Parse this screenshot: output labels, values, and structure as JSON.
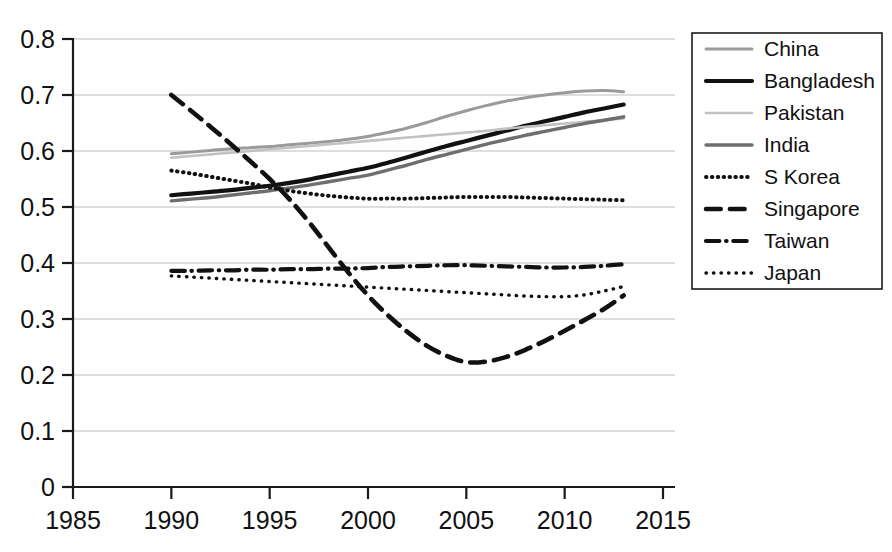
{
  "chart_data": {
    "type": "line",
    "title": "",
    "subtitle": "",
    "xlabel": "",
    "ylabel": "",
    "xlim": [
      1985,
      2015
    ],
    "ylim": [
      0,
      0.8
    ],
    "x_ticks": [
      1985,
      1990,
      1995,
      2000,
      2005,
      2010,
      2015
    ],
    "y_ticks": [
      "0",
      "0.1",
      "0.2",
      "0.3",
      "0.4",
      "0.5",
      "0.6",
      "0.7",
      "0.8"
    ],
    "grid": "horizontal",
    "legend_position": "right",
    "series": [
      {
        "name": "China",
        "style": "solid",
        "color": "#9a9a9a",
        "width": 3.0,
        "x": [
          1990,
          1991,
          1992,
          1993,
          1994,
          1995,
          1996,
          1997,
          1998,
          1999,
          2000,
          2001,
          2002,
          2003,
          2004,
          2005,
          2006,
          2007,
          2008,
          2009,
          2010,
          2011,
          2012,
          2013
        ],
        "values": [
          0.595,
          0.598,
          0.601,
          0.604,
          0.606,
          0.608,
          0.611,
          0.614,
          0.617,
          0.621,
          0.626,
          0.633,
          0.641,
          0.651,
          0.662,
          0.672,
          0.681,
          0.689,
          0.695,
          0.7,
          0.704,
          0.707,
          0.708,
          0.706
        ]
      },
      {
        "name": "Bangladesh",
        "style": "solid",
        "color": "#111111",
        "width": 4.2,
        "x": [
          1990,
          1991,
          1992,
          1993,
          1994,
          1995,
          1996,
          1997,
          1998,
          1999,
          2000,
          2001,
          2002,
          2003,
          2004,
          2005,
          2006,
          2007,
          2008,
          2009,
          2010,
          2011,
          2012,
          2013
        ],
        "values": [
          0.521,
          0.524,
          0.527,
          0.53,
          0.534,
          0.538,
          0.543,
          0.549,
          0.556,
          0.563,
          0.57,
          0.579,
          0.589,
          0.599,
          0.609,
          0.618,
          0.627,
          0.636,
          0.645,
          0.653,
          0.661,
          0.669,
          0.676,
          0.683
        ]
      },
      {
        "name": "Pakistan",
        "style": "solid",
        "color": "#c2c2c2",
        "width": 2.6,
        "x": [
          1990,
          1991,
          1992,
          1993,
          1994,
          1995,
          1996,
          1997,
          1998,
          1999,
          2000,
          2001,
          2002,
          2003,
          2004,
          2005,
          2006,
          2007,
          2008,
          2009,
          2010,
          2011,
          2012,
          2013
        ],
        "values": [
          0.588,
          0.591,
          0.594,
          0.597,
          0.6,
          0.603,
          0.606,
          0.609,
          0.612,
          0.615,
          0.618,
          0.621,
          0.624,
          0.627,
          0.63,
          0.633,
          0.636,
          0.64,
          0.643,
          0.646,
          0.649,
          0.652,
          0.655,
          0.658
        ]
      },
      {
        "name": "India",
        "style": "solid",
        "color": "#6e6e6e",
        "width": 3.4,
        "x": [
          1990,
          1991,
          1992,
          1993,
          1994,
          1995,
          1996,
          1997,
          1998,
          1999,
          2000,
          2001,
          2002,
          2003,
          2004,
          2005,
          2006,
          2007,
          2008,
          2009,
          2010,
          2011,
          2012,
          2013
        ],
        "values": [
          0.511,
          0.514,
          0.517,
          0.521,
          0.525,
          0.529,
          0.534,
          0.539,
          0.545,
          0.551,
          0.557,
          0.566,
          0.575,
          0.585,
          0.594,
          0.603,
          0.612,
          0.62,
          0.628,
          0.635,
          0.642,
          0.649,
          0.655,
          0.661
        ]
      },
      {
        "name": "S Korea",
        "style": "dotted",
        "color": "#111111",
        "width": 4.0,
        "x": [
          1990,
          1991,
          1992,
          1993,
          1994,
          1995,
          1996,
          1997,
          1998,
          1999,
          2000,
          2001,
          2002,
          2003,
          2004,
          2005,
          2006,
          2007,
          2008,
          2009,
          2010,
          2011,
          2012,
          2013
        ],
        "values": [
          0.565,
          0.56,
          0.554,
          0.548,
          0.542,
          0.535,
          0.529,
          0.524,
          0.52,
          0.517,
          0.515,
          0.515,
          0.515,
          0.516,
          0.517,
          0.518,
          0.518,
          0.518,
          0.517,
          0.516,
          0.515,
          0.514,
          0.513,
          0.512
        ]
      },
      {
        "name": "Singapore",
        "style": "dashed",
        "color": "#111111",
        "width": 4.6,
        "x": [
          1990,
          1991,
          1992,
          1993,
          1994,
          1995,
          1996,
          1997,
          1998,
          1999,
          2000,
          2001,
          2002,
          2003,
          2004,
          2005,
          2006,
          2007,
          2008,
          2009,
          2010,
          2011,
          2012,
          2013
        ],
        "values": [
          0.7,
          0.672,
          0.643,
          0.613,
          0.582,
          0.55,
          0.514,
          0.473,
          0.428,
          0.383,
          0.342,
          0.307,
          0.277,
          0.252,
          0.234,
          0.223,
          0.224,
          0.232,
          0.245,
          0.261,
          0.279,
          0.298,
          0.318,
          0.342
        ]
      },
      {
        "name": "Taiwan",
        "style": "dashdot",
        "color": "#111111",
        "width": 4.2,
        "x": [
          1990,
          1991,
          1992,
          1993,
          1994,
          1995,
          1996,
          1997,
          1998,
          1999,
          2000,
          2001,
          2002,
          2003,
          2004,
          2005,
          2006,
          2007,
          2008,
          2009,
          2010,
          2011,
          2012,
          2013
        ],
        "values": [
          0.386,
          0.386,
          0.387,
          0.387,
          0.388,
          0.388,
          0.389,
          0.389,
          0.39,
          0.39,
          0.391,
          0.393,
          0.394,
          0.395,
          0.396,
          0.396,
          0.395,
          0.394,
          0.393,
          0.392,
          0.392,
          0.393,
          0.395,
          0.398
        ]
      },
      {
        "name": "Japan",
        "style": "fine-dotted",
        "color": "#111111",
        "width": 3.4,
        "x": [
          1990,
          1991,
          1992,
          1993,
          1994,
          1995,
          1996,
          1997,
          1998,
          1999,
          2000,
          2001,
          2002,
          2003,
          2004,
          2005,
          2006,
          2007,
          2008,
          2009,
          2010,
          2011,
          2012,
          2013
        ],
        "values": [
          0.377,
          0.375,
          0.373,
          0.371,
          0.369,
          0.367,
          0.365,
          0.363,
          0.361,
          0.359,
          0.357,
          0.355,
          0.353,
          0.351,
          0.349,
          0.347,
          0.345,
          0.343,
          0.341,
          0.34,
          0.34,
          0.343,
          0.35,
          0.358
        ]
      }
    ]
  },
  "legend": {
    "entries": [
      {
        "label": "China"
      },
      {
        "label": "Bangladesh"
      },
      {
        "label": "Pakistan"
      },
      {
        "label": "India"
      },
      {
        "label": "S Korea"
      },
      {
        "label": "Singapore"
      },
      {
        "label": "Taiwan"
      },
      {
        "label": "Japan"
      }
    ]
  },
  "colors": {
    "axis": "#1a1a1a",
    "grid": "#b9bfc6",
    "background": "#ffffff",
    "text": "#111111"
  }
}
